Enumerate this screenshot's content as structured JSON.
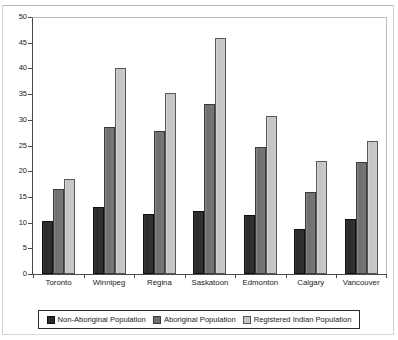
{
  "chart_data": {
    "type": "bar",
    "title": "",
    "subtitle": "",
    "xlabel": "",
    "ylabel": "",
    "ylim": [
      0,
      50
    ],
    "ytick_step": 5,
    "yticks": [
      0,
      5,
      10,
      15,
      20,
      25,
      30,
      35,
      40,
      45,
      50
    ],
    "grid": false,
    "legend_position": "bottom",
    "categories": [
      "Toronto",
      "Winnipeg",
      "Regina",
      "Saskatoon",
      "Edmonton",
      "Calgary",
      "Vancouver"
    ],
    "series": [
      {
        "name": "Non-Aboriginal Population",
        "color": "#2b2b2b",
        "values": [
          10.4,
          13.1,
          11.6,
          12.3,
          11.4,
          8.8,
          10.8
        ]
      },
      {
        "name": "Aboriginal Population",
        "color": "#707070",
        "values": [
          16.5,
          28.6,
          27.8,
          33.0,
          24.8,
          16.0,
          21.8
        ]
      },
      {
        "name": "Registered Indian Population",
        "color": "#c6c6c6",
        "values": [
          18.5,
          40.0,
          35.3,
          46.0,
          30.8,
          22.0,
          25.8
        ]
      }
    ]
  },
  "legend": {
    "items": [
      {
        "label": "Non-Aboriginal Population"
      },
      {
        "label": "Aboriginal Population"
      },
      {
        "label": "Registered Indian Population"
      }
    ]
  }
}
